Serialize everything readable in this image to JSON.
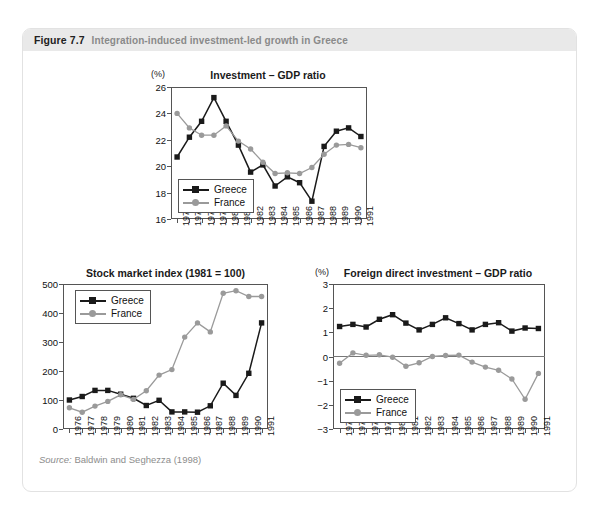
{
  "figure": {
    "number": "Figure 7.7",
    "caption": "Integration-induced investment-led growth in Greece",
    "source_prefix": "Source:",
    "source_text": " Baldwin and Seghezza (1998)"
  },
  "colors": {
    "greece": "#1a1a1a",
    "france": "#9a9a9a",
    "header_band": "#e9e9e9",
    "card_border": "#e2e2e2",
    "axis": "#555555"
  },
  "chart_data": [
    {
      "id": "investment-gdp",
      "type": "line",
      "title": "Investment – GDP ratio",
      "unit_label": "(%)",
      "xlabel": "",
      "ylabel": "",
      "ylim": [
        16,
        26
      ],
      "yticks": [
        16,
        18,
        20,
        22,
        24,
        26
      ],
      "grid": false,
      "legend_position": "bottom-left",
      "categories": [
        "1976",
        "1977",
        "1978",
        "1979",
        "1980",
        "1981",
        "1982",
        "1983",
        "1984",
        "1985",
        "1986",
        "1987",
        "1988",
        "1989",
        "1990",
        "1991"
      ],
      "series": [
        {
          "name": "Greece",
          "marker": "square",
          "color": "#1a1a1a",
          "values": [
            20.7,
            22.2,
            23.4,
            25.2,
            23.4,
            21.6,
            19.55,
            20.1,
            18.5,
            19.2,
            18.75,
            17.35,
            21.5,
            22.65,
            22.9,
            22.25
          ]
        },
        {
          "name": "France",
          "marker": "circle",
          "color": "#9a9a9a",
          "values": [
            24.0,
            22.9,
            22.35,
            22.35,
            23.05,
            21.9,
            21.3,
            20.3,
            19.45,
            19.5,
            19.45,
            19.9,
            20.9,
            21.6,
            21.65,
            21.4
          ]
        }
      ]
    },
    {
      "id": "stock-market-index",
      "type": "line",
      "title": "Stock market index (1981 = 100)",
      "unit_label": "",
      "xlabel": "",
      "ylabel": "",
      "ylim": [
        0,
        500
      ],
      "yticks": [
        0,
        100,
        200,
        300,
        400,
        500
      ],
      "grid": false,
      "legend_position": "top-left",
      "categories": [
        "1976",
        "1977",
        "1978",
        "1979",
        "1980",
        "1981",
        "1982",
        "1983",
        "1984",
        "1985",
        "1986",
        "1987",
        "1988",
        "1989",
        "1990",
        "1991"
      ],
      "series": [
        {
          "name": "Greece",
          "marker": "square",
          "color": "#1a1a1a",
          "values": [
            100,
            112,
            133,
            133,
            120,
            106,
            81,
            99,
            59,
            59,
            58,
            80,
            158,
            116,
            192,
            366
          ]
        },
        {
          "name": "France",
          "marker": "circle",
          "color": "#9a9a9a",
          "values": [
            73,
            58,
            79,
            95,
            118,
            102,
            132,
            186,
            205,
            317,
            366,
            335,
            468,
            477,
            457,
            457
          ]
        }
      ]
    },
    {
      "id": "fdi-gdp",
      "type": "line",
      "title": "Foreign direct investment – GDP ratio",
      "unit_label": "(%)",
      "xlabel": "",
      "ylabel": "",
      "ylim": [
        -3,
        3
      ],
      "yticks": [
        -3,
        -2,
        -1,
        0,
        1,
        2,
        3
      ],
      "ytick_labels": [
        "−3",
        "−2",
        "−1",
        "0",
        "1",
        "2",
        "3"
      ],
      "grid": false,
      "zero_line": true,
      "legend_position": "bottom-left",
      "categories": [
        "1976",
        "1977",
        "1978",
        "1979",
        "1980",
        "1981",
        "1982",
        "1983",
        "1984",
        "1985",
        "1986",
        "1987",
        "1988",
        "1989",
        "1990",
        "1991"
      ],
      "series": [
        {
          "name": "Greece",
          "marker": "square",
          "color": "#1a1a1a",
          "values": [
            1.24,
            1.33,
            1.22,
            1.54,
            1.73,
            1.38,
            1.1,
            1.33,
            1.6,
            1.36,
            1.1,
            1.33,
            1.4,
            1.05,
            1.18,
            1.16
          ]
        },
        {
          "name": "France",
          "marker": "circle",
          "color": "#9a9a9a",
          "values": [
            -0.28,
            0.15,
            0.05,
            0.07,
            -0.03,
            -0.4,
            -0.26,
            0.0,
            0.04,
            0.06,
            -0.23,
            -0.44,
            -0.57,
            -0.93,
            -1.77,
            -0.7
          ]
        }
      ]
    }
  ]
}
